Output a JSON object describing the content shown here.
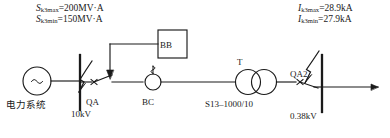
{
  "diagram": {
    "stroke_color": "#1a1a1a",
    "background": "#ffffff",
    "source_labels": {
      "sk_max": {
        "symbol": "S",
        "sub": "k3max",
        "equals": "=200MV·A"
      },
      "sk_min": {
        "symbol": "S",
        "sub": "k3min",
        "equals": "=150MV·A"
      }
    },
    "fault_current_labels": {
      "ik_max": {
        "symbol": "I",
        "sub": "k3max",
        "equals": "=28.9kA"
      },
      "ik_min": {
        "symbol": "I",
        "sub": "k3min",
        "equals": "=27.9kA"
      }
    },
    "components": {
      "power_system": "电力系统",
      "source_symbol": "~",
      "bus_hv": "10kV",
      "breaker_hv": "QA",
      "relay_unit": "BB",
      "sensor": "BC",
      "transformer": "T",
      "transformer_spec": "S13–1000/10",
      "breaker_lv": "QA2",
      "bus_lv": "0.38kV"
    }
  }
}
